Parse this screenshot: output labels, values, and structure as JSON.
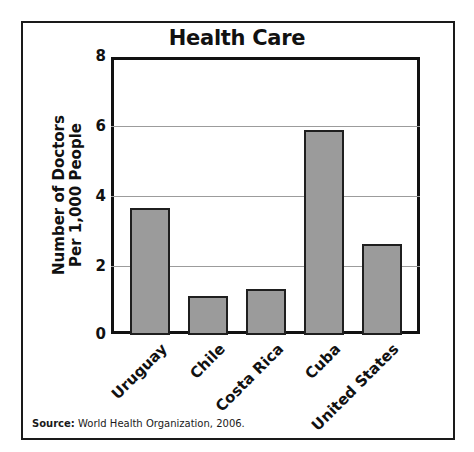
{
  "chart_data": {
    "type": "bar",
    "title": "Health Care",
    "xlabel": "",
    "ylabel": "Number of Doctors Per 1,000 People",
    "ylabel_lines": [
      "Number of Doctors",
      "Per 1,000 People"
    ],
    "categories": [
      "Uruguay",
      "Chile",
      "Costa Rica",
      "Cuba",
      "United States"
    ],
    "values": [
      3.65,
      1.1,
      1.3,
      5.9,
      2.6
    ],
    "ylim": [
      0,
      8
    ],
    "yticks": [
      0,
      2,
      4,
      6,
      8
    ],
    "grid": true,
    "legend": null,
    "source_label": "Source:",
    "source_text": "World Health Organization, 2006.",
    "colors": {
      "bar_fill": "#9b9b9b",
      "bar_border": "#1f1f1f",
      "gridline": "#9c9c9c",
      "axis": "#111111"
    }
  }
}
